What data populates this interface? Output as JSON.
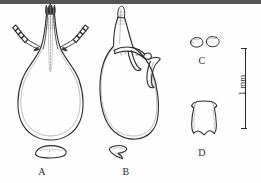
{
  "figure": {
    "type": "scientific-line-drawing-plate",
    "background_color": "#fefefe",
    "ink_color": "#2b2b2b",
    "top_band_color": "#555558",
    "panels": [
      {
        "id": "A",
        "label": "A",
        "description": "ventral view of bulbous structure with paired segmented lateral appendages and dark apical crown, with separate oval sclerite below"
      },
      {
        "id": "B",
        "label": "B",
        "description": "lateral view of bulbous structure with single tapering apical process and lateral projections, with separate arrowhead sclerite below"
      },
      {
        "id": "C",
        "label": "C",
        "description": "two small oval sclerites"
      },
      {
        "id": "D",
        "label": "D",
        "description": "single trapezoidal plate sclerite with notched margins"
      }
    ],
    "scalebar": {
      "label": "1 mm",
      "orientation": "vertical",
      "position": "right"
    }
  }
}
